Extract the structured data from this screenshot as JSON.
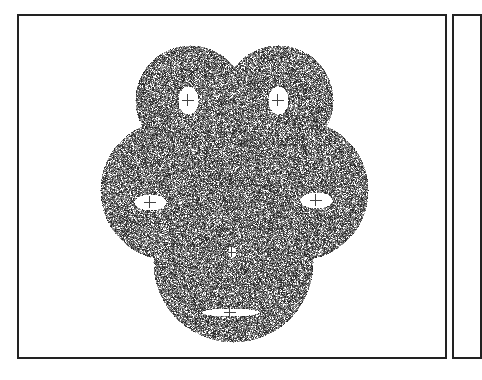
{
  "figure": {
    "panels": [
      {
        "id": "main",
        "frame": {
          "x": 17,
          "y": 14,
          "w": 430,
          "h": 345,
          "border_color": "#222222"
        },
        "pattern": {
          "type": "stippled-five-lobed-shape",
          "dot_colors": [
            "#2a2a2a",
            "#555555",
            "#808080",
            "#a8a8a8"
          ],
          "background": "#ffffff",
          "lobes": [
            {
              "name": "top-left",
              "cx": 190,
              "cy": 100,
              "r": 55
            },
            {
              "name": "top-right",
              "cx": 278,
              "cy": 100,
              "r": 55
            },
            {
              "name": "left",
              "cx": 170,
              "cy": 190,
              "r": 70
            },
            {
              "name": "right",
              "cx": 298,
              "cy": 190,
              "r": 70
            },
            {
              "name": "center",
              "cx": 233,
              "cy": 200,
              "r": 75
            },
            {
              "name": "bottom",
              "cx": 233,
              "cy": 262,
              "r": 80
            }
          ],
          "holes": [
            {
              "name": "top-left-hole",
              "cx": 188,
              "cy": 100,
              "rx": 10,
              "ry": 14
            },
            {
              "name": "top-right-hole",
              "cx": 278,
              "cy": 100,
              "rx": 10,
              "ry": 14
            },
            {
              "name": "left-hole",
              "cx": 150,
              "cy": 202,
              "rx": 16,
              "ry": 8
            },
            {
              "name": "right-hole",
              "cx": 316,
              "cy": 200,
              "rx": 16,
              "ry": 8
            },
            {
              "name": "bottom-hole",
              "cx": 230,
              "cy": 312,
              "rx": 28,
              "ry": 4
            },
            {
              "name": "center-hole",
              "cx": 232,
              "cy": 252,
              "rx": 4,
              "ry": 5
            }
          ]
        }
      },
      {
        "id": "next",
        "frame": {
          "x": 452,
          "y": 14,
          "w": 30,
          "h": 345,
          "border_color": "#222222"
        },
        "partial": true
      }
    ]
  }
}
